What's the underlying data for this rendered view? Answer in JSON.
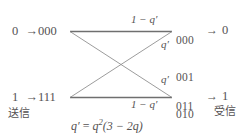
{
  "diagram": {
    "line_color": "#6b6b6b",
    "text_color": "#555253",
    "background": "#ffffff",
    "source": {
      "top": {
        "symbol": "0",
        "arrow": "→",
        "codeword": "000"
      },
      "bottom": {
        "symbol": "1",
        "arrow": "→",
        "codeword": "111"
      },
      "caption": "送信"
    },
    "destination": {
      "top": {
        "bits": [
          "000",
          "001",
          "010",
          "100"
        ],
        "arrow": "→",
        "symbol": "0"
      },
      "bottom": {
        "bits": [
          "011",
          "101",
          "110",
          "111"
        ],
        "arrow": "→",
        "symbol": "1"
      },
      "caption": "受信"
    },
    "edge_labels": {
      "top_straight": "1 − q′",
      "top_cross": "q′",
      "bottom_cross": "q′",
      "bottom_straight": "1 − q′"
    },
    "formula": {
      "lhs": "q′",
      "eq": "=",
      "base": "q",
      "exponent": "2",
      "factor": "(3 − 2q)",
      "full": "q′ = q²(3 − 2q)"
    }
  }
}
